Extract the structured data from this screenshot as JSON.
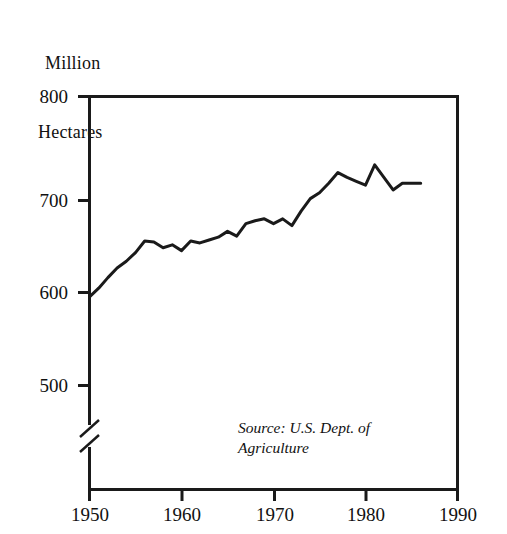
{
  "figure": {
    "title_lines": [
      "Million",
      "Hectares"
    ],
    "source_lines": [
      "Source: U.S. Dept. of",
      "Agriculture"
    ],
    "line_color": "#1a1a1a",
    "axis_color": "#1a1a1a",
    "background": "#ffffff"
  },
  "axes": {
    "y_ticks": [
      "800",
      "700",
      "600",
      "500"
    ],
    "x_ticks": [
      "1950",
      "1960",
      "1970",
      "1980",
      "1990"
    ],
    "y_axis_break": "yes"
  },
  "chart_data": {
    "type": "line",
    "title": "Million Hectares",
    "xlabel": "",
    "ylabel": "Million Hectares",
    "xlim": [
      1950,
      1990
    ],
    "ylim": [
      500,
      800
    ],
    "ylim_note": "axis broken below 500",
    "grid": false,
    "legend": null,
    "annotations": [
      "Source: U.S. Dept. of Agriculture"
    ],
    "x": [
      1950,
      1951,
      1952,
      1953,
      1954,
      1955,
      1956,
      1957,
      1958,
      1959,
      1960,
      1961,
      1962,
      1963,
      1964,
      1965,
      1966,
      1967,
      1968,
      1969,
      1970,
      1971,
      1972,
      1973,
      1974,
      1975,
      1976,
      1977,
      1978,
      1979,
      1980,
      1981,
      1982,
      1983,
      1984,
      1985,
      1986
    ],
    "values": [
      592,
      601,
      612,
      622,
      629,
      638,
      650,
      649,
      643,
      646,
      640,
      650,
      648,
      651,
      654,
      660,
      655,
      668,
      671,
      673,
      668,
      673,
      666,
      681,
      694,
      700,
      710,
      721,
      716,
      712,
      708,
      729,
      716,
      703,
      710,
      710,
      710
    ],
    "series": [
      {
        "name": "World grain harvested area",
        "values": [
          592,
          601,
          612,
          622,
          629,
          638,
          650,
          649,
          643,
          646,
          640,
          650,
          648,
          651,
          654,
          660,
          655,
          668,
          671,
          673,
          668,
          673,
          666,
          681,
          694,
          700,
          710,
          721,
          716,
          712,
          708,
          729,
          716,
          703,
          710,
          710,
          710
        ]
      }
    ]
  }
}
